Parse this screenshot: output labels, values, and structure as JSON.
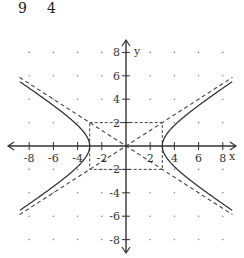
{
  "header": {
    "left": "9",
    "right": "4"
  },
  "chart_data": {
    "type": "line",
    "title": "",
    "equation": "x^2/9 - y^2/4 = 1",
    "xlabel": "x",
    "ylabel": "y",
    "xlim": [
      -8,
      8
    ],
    "ylim": [
      -8,
      8
    ],
    "xticks": [
      -8,
      -6,
      -4,
      -2,
      2,
      4,
      6,
      8
    ],
    "xtick_labels": [
      "-8",
      "-6",
      "-4",
      "-2",
      "2",
      "4",
      "6",
      "8"
    ],
    "yticks": [
      -8,
      -6,
      -4,
      -2,
      2,
      4,
      6,
      8
    ],
    "ytick_labels": [
      "-8",
      "-6",
      "-4",
      "-2",
      "2",
      "4",
      "6",
      "8"
    ],
    "grid": "dots",
    "vertices": [
      [
        -3,
        0
      ],
      [
        3,
        0
      ]
    ],
    "central_box": {
      "x": [
        -3,
        3
      ],
      "y": [
        -2,
        2
      ],
      "style": "dashed"
    },
    "asymptotes": [
      {
        "name": "y = (2/3)x",
        "slope": 0.6667,
        "style": "dashed"
      },
      {
        "name": "y = -(2/3)x",
        "slope": -0.6667,
        "style": "dashed"
      }
    ],
    "series": [
      {
        "name": "hyperbola right branch",
        "style": "solid",
        "x": [
          3,
          3.2,
          3.6,
          4.5,
          6,
          7.5,
          9
        ],
        "y_upper": [
          0,
          0.74,
          1.33,
          2.24,
          3.46,
          4.58,
          5.66
        ]
      },
      {
        "name": "hyperbola left branch",
        "style": "solid",
        "x": [
          -3,
          -3.2,
          -3.6,
          -4.5,
          -6,
          -7.5,
          -9
        ],
        "y_upper": [
          0,
          0.74,
          1.33,
          2.24,
          3.46,
          4.58,
          5.66
        ]
      }
    ]
  }
}
